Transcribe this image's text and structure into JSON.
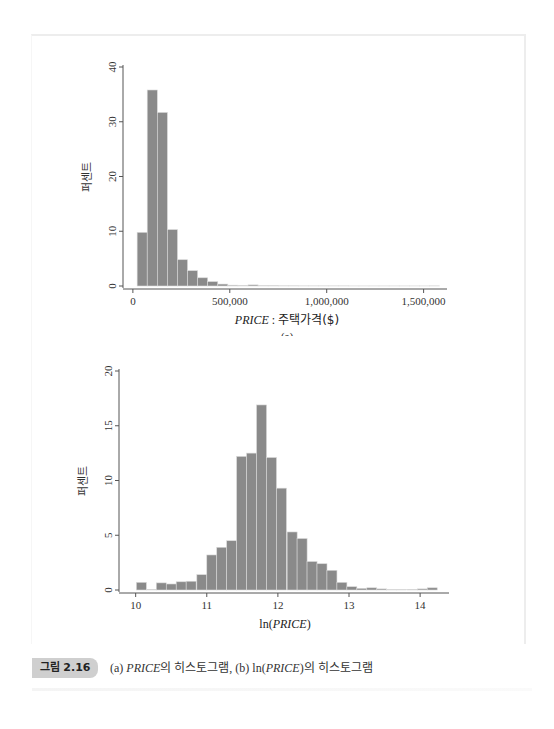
{
  "figure": {
    "label": "그림 2.16",
    "caption_parts": [
      "(a) ",
      "PRICE",
      "의 히스토그램, (b) ln(",
      "PRICE",
      ")의 히스토그램"
    ]
  },
  "colors": {
    "bar_fill": "#8a8a8a",
    "bar_edge": "#d9d9d9",
    "axis": "#555555",
    "badge": "#cfcfcf"
  },
  "chart_data": [
    {
      "type": "bar",
      "subtitle": "(a)",
      "title": "",
      "xlabel_italic": "PRICE",
      "xlabel_rest": " : 주택가격($)",
      "xlabel": "PRICE : 주택가격($)",
      "ylabel": "퍼센트",
      "xlim": [
        -20000,
        1600000
      ],
      "ylim": [
        0,
        40
      ],
      "xticks": [
        0,
        500000,
        1000000,
        1500000
      ],
      "xtick_labels": [
        "0",
        "500,000",
        "1,000,000",
        "1,500,000"
      ],
      "yticks": [
        0,
        10,
        20,
        30,
        40
      ],
      "ytick_labels": [
        "0",
        "10",
        "20",
        "30",
        "40"
      ],
      "grid": false,
      "bin_width": 52000,
      "bin_starts": [
        22000,
        74000,
        126000,
        178000,
        230000,
        282000,
        334000,
        386000,
        438000,
        490000,
        542000,
        594000,
        646000,
        698000,
        750000,
        802000,
        854000,
        906000,
        958000,
        1010000,
        1062000,
        1114000,
        1166000,
        1218000,
        1270000,
        1322000,
        1374000,
        1426000,
        1478000,
        1530000
      ],
      "values": [
        9.8,
        35.8,
        31.7,
        10.3,
        4.8,
        2.8,
        1.5,
        0.8,
        0.35,
        0.15,
        0.1,
        0.2,
        0.05,
        0.05,
        0.03,
        0.03,
        0.02,
        0.02,
        0.02,
        0.02,
        0.02,
        0.01,
        0.01,
        0.01,
        0.01,
        0.01,
        0.01,
        0.01,
        0.01,
        0.02
      ]
    },
    {
      "type": "bar",
      "subtitle": "(b)",
      "title": "",
      "xlabel_pre": "ln(",
      "xlabel_italic": "PRICE",
      "xlabel_post": ")",
      "xlabel": "ln(PRICE)",
      "ylabel": "퍼센트",
      "xlim": [
        9.85,
        14.35
      ],
      "ylim": [
        0,
        20
      ],
      "xticks": [
        10,
        11,
        12,
        13,
        14
      ],
      "xtick_labels": [
        "10",
        "11",
        "12",
        "13",
        "14"
      ],
      "yticks": [
        0,
        5,
        10,
        15,
        20
      ],
      "ytick_labels": [
        "0",
        "5",
        "10",
        "15",
        "20"
      ],
      "grid": false,
      "bin_width": 0.1407,
      "bin_starts": [
        10.01,
        10.15,
        10.29,
        10.43,
        10.57,
        10.71,
        10.86,
        11.0,
        11.14,
        11.28,
        11.42,
        11.56,
        11.7,
        11.84,
        11.98,
        12.13,
        12.27,
        12.41,
        12.55,
        12.69,
        12.83,
        12.97,
        13.11,
        13.25,
        13.39,
        13.53,
        13.67,
        13.82,
        13.96,
        14.1
      ],
      "values": [
        0.7,
        0.05,
        0.65,
        0.55,
        0.75,
        0.8,
        1.4,
        3.2,
        3.9,
        4.5,
        12.2,
        12.5,
        16.9,
        12.1,
        9.3,
        5.3,
        4.7,
        2.6,
        2.4,
        1.8,
        0.7,
        0.3,
        0.15,
        0.2,
        0.1,
        0.03,
        0.03,
        0.05,
        0.1,
        0.2
      ]
    }
  ]
}
